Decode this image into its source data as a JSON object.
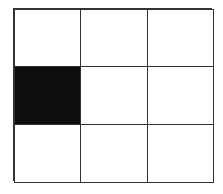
{
  "grid": {
    "rows": 3,
    "cols": 3,
    "cells": [
      {
        "row": 0,
        "col": 0,
        "filled": false
      },
      {
        "row": 0,
        "col": 1,
        "filled": false
      },
      {
        "row": 0,
        "col": 2,
        "filled": false
      },
      {
        "row": 1,
        "col": 0,
        "filled": true
      },
      {
        "row": 1,
        "col": 1,
        "filled": false
      },
      {
        "row": 1,
        "col": 2,
        "filled": false
      },
      {
        "row": 2,
        "col": 0,
        "filled": false
      },
      {
        "row": 2,
        "col": 1,
        "filled": false
      },
      {
        "row": 2,
        "col": 2,
        "filled": false
      }
    ],
    "colors": {
      "filled": "#0d0d0d",
      "empty": "#ffffff",
      "line": "#333333"
    }
  }
}
